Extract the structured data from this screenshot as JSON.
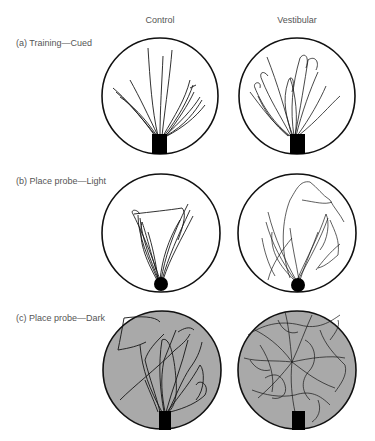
{
  "columns": [
    {
      "label": "Control"
    },
    {
      "label": "Vestibular"
    }
  ],
  "rows": [
    {
      "label": "(a)  Training—Cued",
      "background": "white",
      "platform": "square"
    },
    {
      "label": "(b)  Place probe—Light",
      "background": "white",
      "platform": "circle"
    },
    {
      "label": "(c)  Place probe—Dark",
      "background": "gray",
      "platform": "square"
    }
  ],
  "colors": {
    "arena_stroke": "#111111",
    "arena_fill_light": "#ffffff",
    "arena_fill_dark": "#a9a9a9",
    "path": "#1a1a1a",
    "platform": "#000000",
    "text": "#555555"
  }
}
